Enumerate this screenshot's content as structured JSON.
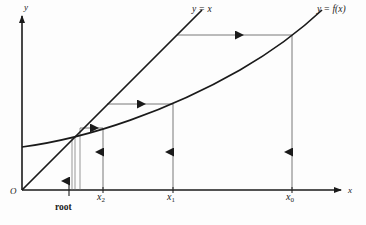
{
  "figure": {
    "background_color": "#fdfdfd",
    "ink_color": "#1a1a1a",
    "thin_color": "#555555"
  },
  "axes": {
    "y_axis_label": "y",
    "x_axis_label": "x",
    "origin_label": "O",
    "x_axis_y_px": 190,
    "y_axis_x_px": 22,
    "x_axis_end_px": 345,
    "y_axis_top_px": 12
  },
  "curves": [
    {
      "name": "identity-line",
      "label": "y = x",
      "label_x_px": 192,
      "label_y_px": 6,
      "from": [
        22,
        190
      ],
      "to": [
        200,
        12
      ]
    },
    {
      "name": "function-curve",
      "label_prefix": "y = f(",
      "label_var": "x",
      "label_suffix": ")",
      "label": "y = f(x)",
      "label_x_px": 318,
      "label_y_px": 6,
      "y_intercept_px": 147,
      "end": [
        320,
        12
      ]
    }
  ],
  "ticks": [
    {
      "name": "x2",
      "text": "x",
      "sub": "2",
      "x_px": 103,
      "label_x_px": 98,
      "label_y_px": 192
    },
    {
      "name": "x1",
      "text": "x",
      "sub": "1",
      "x_px": 173,
      "label_x_px": 168,
      "label_y_px": 192
    },
    {
      "name": "x0",
      "text": "x",
      "sub": "0",
      "x_px": 292,
      "label_x_px": 287,
      "label_y_px": 192
    }
  ],
  "root": {
    "label": "root",
    "label_x_px": 55,
    "label_y_px": 205,
    "x_px": 69,
    "intersection_y_px": 135,
    "arrow_from_y_px": 188,
    "arrow_to_y_px": 160
  },
  "cobweb": {
    "description": "Staircase from x0 inward to the root: vertical up-arrows at each iterate, horizontal left-arrows back to y = x.",
    "vertical_arrows": [
      {
        "name": "vertical-at-x0",
        "x_px": 292,
        "y_bottom_px": 190,
        "y_top_px": 35,
        "arrowhead_y_px": 155
      },
      {
        "name": "vertical-at-x1",
        "x_px": 173,
        "y_bottom_px": 190,
        "y_top_px": 104,
        "arrowhead_y_px": 155
      },
      {
        "name": "vertical-at-x2",
        "x_px": 103,
        "y_bottom_px": 190,
        "y_top_px": 128,
        "arrowhead_y_px": 155
      }
    ],
    "horizontal_arrows": [
      {
        "name": "horizontal-from-x0",
        "y_px": 35,
        "x_from_px": 292,
        "x_to_px": 177,
        "arrowhead_x_px": 238
      },
      {
        "name": "horizontal-from-x1",
        "y_px": 104,
        "x_from_px": 173,
        "x_to_px": 107,
        "arrowhead_x_px": 140
      },
      {
        "name": "horizontal-from-x2",
        "y_px": 128,
        "x_from_px": 103,
        "x_to_px": 80,
        "arrowhead_x_px": 92
      }
    ],
    "converging_lines": [
      {
        "name": "converging-line-x3",
        "x_px": 75
      },
      {
        "name": "converging-line-x4",
        "x_px": 79
      },
      {
        "name": "converging-line-x5",
        "x_px": 72
      }
    ]
  }
}
